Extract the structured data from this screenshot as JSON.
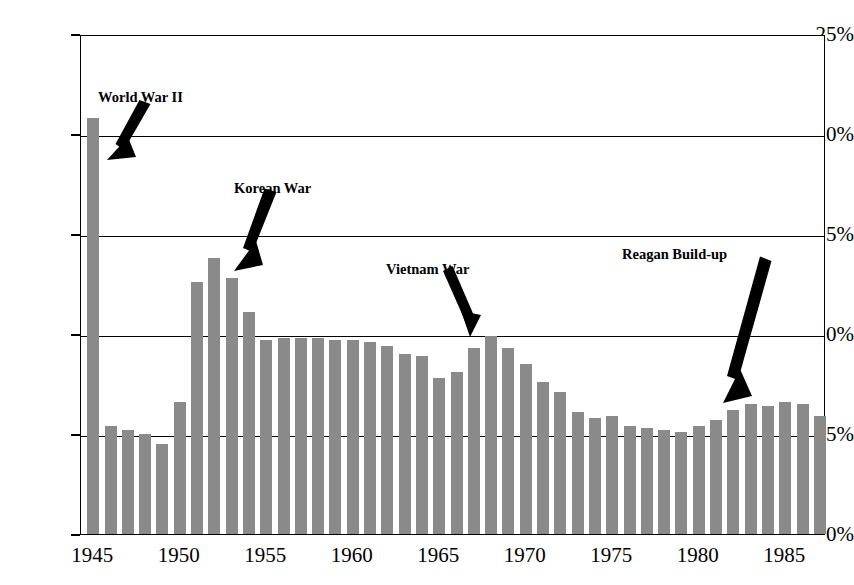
{
  "chart_data": {
    "type": "bar",
    "title": "",
    "subtitle": "",
    "xlabel": "",
    "ylabel": "",
    "ylim": [
      0,
      25
    ],
    "ytick_labels": [
      "0%",
      "5%",
      "10%",
      "15%",
      "20%",
      "25%"
    ],
    "ytick_values": [
      0,
      5,
      10,
      15,
      20,
      25
    ],
    "xtick_labels": [
      "1945",
      "1950",
      "1955",
      "1960",
      "1965",
      "1970",
      "1975",
      "1980",
      "1985"
    ],
    "xtick_values": [
      1945,
      1950,
      1955,
      1960,
      1965,
      1970,
      1975,
      1980,
      1985
    ],
    "grid": true,
    "legend": "none",
    "bar_color": "#8a8a8a",
    "axis_color": "#000000",
    "categories": [
      1945,
      1946,
      1947,
      1948,
      1949,
      1950,
      1951,
      1952,
      1953,
      1954,
      1955,
      1956,
      1957,
      1958,
      1959,
      1960,
      1961,
      1962,
      1963,
      1964,
      1965,
      1966,
      1967,
      1968,
      1969,
      1970,
      1971,
      1972,
      1973,
      1974,
      1975,
      1976,
      1977,
      1978,
      1979,
      1980,
      1981,
      1982,
      1983,
      1984,
      1985,
      1986,
      1987
    ],
    "values": [
      20.8,
      5.4,
      5.2,
      5.0,
      4.5,
      6.6,
      12.6,
      13.8,
      12.8,
      11.1,
      9.7,
      9.8,
      9.8,
      9.8,
      9.7,
      9.7,
      9.6,
      9.4,
      9.0,
      8.9,
      7.8,
      8.1,
      9.3,
      9.9,
      9.3,
      8.5,
      7.6,
      7.1,
      6.1,
      5.8,
      5.9,
      5.4,
      5.3,
      5.2,
      5.1,
      5.4,
      5.7,
      6.2,
      6.5,
      6.4,
      6.6,
      6.5,
      5.9
    ],
    "annotations": [
      {
        "label": "World War II",
        "target_year": 1945,
        "target_value": 20.8
      },
      {
        "label": "Korean War",
        "target_year": 1952,
        "target_value": 13.8
      },
      {
        "label": "Vietnam War",
        "target_year": 1967,
        "target_value": 9.3
      },
      {
        "label": "Reagan Build-up",
        "target_year": 1982,
        "target_value": 6.2
      }
    ]
  }
}
